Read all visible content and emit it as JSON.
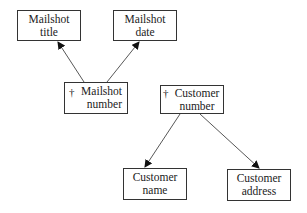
{
  "diagram": {
    "type": "functional-dependency",
    "key_marker": "†",
    "nodes": [
      {
        "id": "mailshot_title",
        "lines": [
          "Mailshot",
          "title"
        ],
        "key": false
      },
      {
        "id": "mailshot_date",
        "lines": [
          "Mailshot",
          "date"
        ],
        "key": false
      },
      {
        "id": "mailshot_number",
        "lines": [
          "Mailshot",
          "number"
        ],
        "key": true
      },
      {
        "id": "customer_number",
        "lines": [
          "Customer",
          "number"
        ],
        "key": true
      },
      {
        "id": "customer_name",
        "lines": [
          "Customer",
          "name"
        ],
        "key": false
      },
      {
        "id": "customer_address",
        "lines": [
          "Customer",
          "address"
        ],
        "key": false
      }
    ],
    "edges": [
      {
        "from": "mailshot_number",
        "to": "mailshot_title"
      },
      {
        "from": "mailshot_number",
        "to": "mailshot_date"
      },
      {
        "from": "customer_number",
        "to": "customer_name"
      },
      {
        "from": "customer_number",
        "to": "customer_address"
      }
    ],
    "colors": {
      "line": "#333333",
      "background": "#ffffff",
      "text": "#222222"
    }
  }
}
